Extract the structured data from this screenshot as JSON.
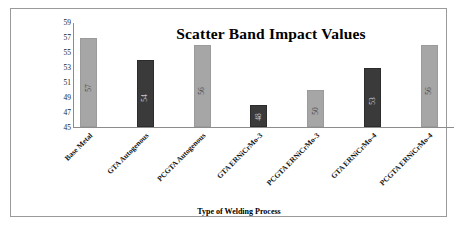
{
  "chart_data": {
    "type": "bar",
    "title": "Scatter Band Impact Values",
    "xlabel": "Type of Welding Process",
    "ylabel": "Impact Energy (J)",
    "categories": [
      "Base Metal",
      "GTA Autogenous",
      "PCGTA Autogenous",
      "GTA ERNiCrMo-3",
      "PCGTA ERNiCrMo-3",
      "GTA ERNiCrMo-4",
      "PCGTA ERNiCrMo-4"
    ],
    "values": [
      57,
      54,
      56,
      48,
      50,
      53,
      56
    ],
    "bar_colors": [
      "#a6a6a6",
      "#3a3a3a",
      "#a6a6a6",
      "#3a3a3a",
      "#a6a6a6",
      "#3a3a3a",
      "#a6a6a6"
    ],
    "ylim": [
      45,
      59
    ],
    "yticks": [
      59,
      57,
      55,
      53,
      51,
      49,
      47,
      45
    ],
    "ytick_step": 2,
    "grid": false,
    "legend": false,
    "data_labels": [
      "57",
      "54",
      "56",
      "48",
      "50",
      "53",
      "56"
    ],
    "data_label_rotation": -90,
    "xtick_rotation": -45
  },
  "colors": {
    "light_bar": "#a6a6a6",
    "dark_bar": "#3a3a3a",
    "axis": "#8c8c8c",
    "frame": "#9a9a9a",
    "background": "#ffffff"
  }
}
